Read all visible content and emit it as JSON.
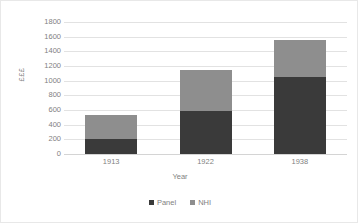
{
  "chart_data": {
    "type": "bar",
    "subtype": "stacked-column",
    "title": "",
    "xlabel": "Year",
    "ylabel": "£££",
    "categories": [
      "1913",
      "1922",
      "1938"
    ],
    "series": [
      {
        "name": "Panel",
        "color": "#3a3a3a",
        "values": [
          210,
          580,
          1045
        ]
      },
      {
        "name": "NHI",
        "color": "#8e8e8e",
        "values": [
          320,
          560,
          510
        ]
      }
    ],
    "totals": [
      530,
      1140,
      1555
    ],
    "ylim": [
      0,
      1800
    ],
    "ytick_step": 200,
    "yticks": [
      "1800",
      "1600",
      "1400",
      "1200",
      "1000",
      "800",
      "600",
      "400",
      "200",
      "0"
    ],
    "ytick_values": [
      1800,
      1600,
      1400,
      1200,
      1000,
      800,
      600,
      400,
      200,
      0
    ],
    "grid": true,
    "grid_color": "#e2e2e2",
    "legend_position": "bottom",
    "plot_background": "#ffffff",
    "axis_text_color": "#7f7f7f",
    "frame_border_color": "#e8e8e8"
  },
  "legend": {
    "items": [
      {
        "label": "Panel",
        "marker": "square-marker-dark"
      },
      {
        "label": "NHI",
        "marker": "square-marker-light"
      }
    ]
  }
}
